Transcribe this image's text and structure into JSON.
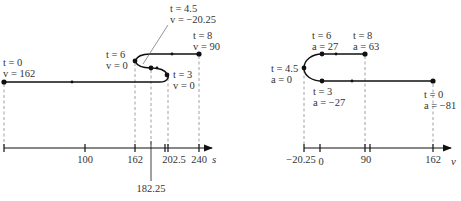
{
  "left_diagram": {
    "title": "Position motion diagram",
    "axis_label": "s",
    "ticks": [
      "100",
      "162",
      "202.5",
      "240"
    ],
    "below_tick": "182.25",
    "points": [
      {
        "t": "t = 0",
        "val": "v = 162"
      },
      {
        "t": "t = 3",
        "val": "v = 0"
      },
      {
        "t": "t = 4.5",
        "val": "v = −20.25"
      },
      {
        "t": "t = 6",
        "val": "v = 0"
      },
      {
        "t": "t = 8",
        "val": "v = 90"
      }
    ]
  },
  "right_diagram": {
    "title": "Velocity motion diagram",
    "axis_label": "v",
    "ticks": [
      "−20.25",
      "0",
      "90",
      "162"
    ],
    "points": [
      {
        "t": "t = 0",
        "val": "a = −81"
      },
      {
        "t": "t = 3",
        "val": "a = −27"
      },
      {
        "t": "t = 4.5",
        "val": "a = 0"
      },
      {
        "t": "t = 6",
        "val": "a = 27"
      },
      {
        "t": "t = 8",
        "val": "a = 63"
      }
    ]
  }
}
